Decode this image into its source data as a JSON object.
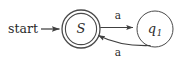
{
  "figure": {
    "background_color": "#ffffff",
    "stroke_color": "#404040",
    "text_color": "#2b2b2b",
    "width": 186,
    "height": 59
  },
  "start_marker": {
    "label": "start",
    "arrow_name": "start-arrow"
  },
  "states": [
    {
      "id": "S",
      "label": "S",
      "subscript": "",
      "accepting": true,
      "cx": 81,
      "cy": 29,
      "r_outer": 19,
      "r_inner": 15.5
    },
    {
      "id": "q1",
      "label": "q",
      "subscript": "1",
      "accepting": false,
      "cx": 155,
      "cy": 29,
      "r_outer": 18,
      "r_inner": 18
    }
  ],
  "transitions": [
    {
      "id": "S-to-q1",
      "from": "S",
      "to": "q1",
      "label": "a",
      "label_x": 118,
      "label_y": 17,
      "shape": "straight"
    },
    {
      "id": "q1-to-S",
      "from": "q1",
      "to": "S",
      "label": "a",
      "label_x": 118,
      "label_y": 50,
      "shape": "curved"
    }
  ]
}
